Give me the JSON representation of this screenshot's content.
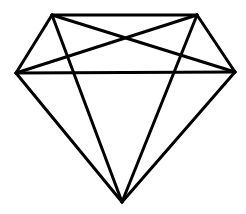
{
  "figure": {
    "width": 246,
    "height": 214,
    "background": "#ffffff",
    "stroke_color": "#000000",
    "stroke_width": 3,
    "vertices": {
      "top_left": [
        52,
        15
      ],
      "top_right": [
        197,
        15
      ],
      "left": [
        16,
        73
      ],
      "right": [
        235,
        72
      ],
      "bottom": [
        122,
        202
      ]
    },
    "edges": [
      {
        "name": "table-top-edge",
        "from": "top_left",
        "to": "top_right"
      },
      {
        "name": "girdle-edge",
        "from": "left",
        "to": "right"
      },
      {
        "name": "upper-left-edge",
        "from": "top_left",
        "to": "left"
      },
      {
        "name": "upper-right-edge",
        "from": "top_right",
        "to": "right"
      },
      {
        "name": "cross-diagonal-a",
        "from": "top_left",
        "to": "right"
      },
      {
        "name": "cross-diagonal-b",
        "from": "top_right",
        "to": "left"
      },
      {
        "name": "inner-left-pavilion-edge",
        "from": "top_left",
        "to": "bottom"
      },
      {
        "name": "inner-right-pavilion-edge",
        "from": "top_right",
        "to": "bottom"
      },
      {
        "name": "outer-left-pavilion-edge",
        "from": "left",
        "to": "bottom"
      },
      {
        "name": "outer-right-pavilion-edge",
        "from": "right",
        "to": "bottom"
      }
    ]
  }
}
